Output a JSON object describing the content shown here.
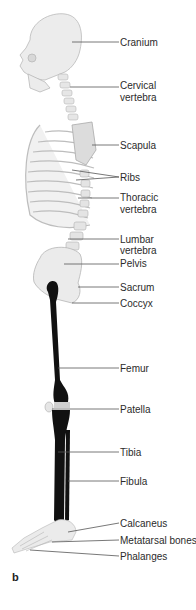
{
  "figure": {
    "panel_letter": "b",
    "labels": [
      {
        "text": "Cranium",
        "y": 37
      },
      {
        "text": "Cervical",
        "y": 80
      },
      {
        "text": "vertebra",
        "y": 92
      },
      {
        "text": "Scapula",
        "y": 140
      },
      {
        "text": "Ribs",
        "y": 172
      },
      {
        "text": "Thoracic",
        "y": 192
      },
      {
        "text": "vertebra",
        "y": 204
      },
      {
        "text": "Lumbar",
        "y": 234
      },
      {
        "text": "vertebra",
        "y": 245
      },
      {
        "text": "Pelvis",
        "y": 258
      },
      {
        "text": "Sacrum",
        "y": 282
      },
      {
        "text": "Coccyx",
        "y": 298
      },
      {
        "text": "Femur",
        "y": 363
      },
      {
        "text": "Patella",
        "y": 404
      },
      {
        "text": "Tibia",
        "y": 447
      },
      {
        "text": "Fibula",
        "y": 476
      },
      {
        "text": "Calcaneus",
        "y": 518
      },
      {
        "text": "Metatarsal bones",
        "y": 535
      },
      {
        "text": "Phalanges",
        "y": 551
      }
    ],
    "colors": {
      "bone_fill": "#ececec",
      "bone_stroke": "#b9b9b9",
      "highlight_bone": "#111111",
      "leader_line": "#555555",
      "label_text": "#2b2b2b"
    }
  }
}
